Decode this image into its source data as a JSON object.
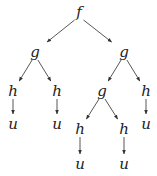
{
  "diagram": {
    "type": "tree",
    "nodes": [
      {
        "id": "n0",
        "label": "f",
        "x": 79,
        "y": 13
      },
      {
        "id": "n1",
        "label": "g",
        "x": 35,
        "y": 53
      },
      {
        "id": "n2",
        "label": "g",
        "x": 124,
        "y": 53
      },
      {
        "id": "n3",
        "label": "h",
        "x": 13,
        "y": 92
      },
      {
        "id": "n4",
        "label": "h",
        "x": 57,
        "y": 92
      },
      {
        "id": "n5",
        "label": "g",
        "x": 102,
        "y": 92
      },
      {
        "id": "n6",
        "label": "h",
        "x": 146,
        "y": 92
      },
      {
        "id": "n7",
        "label": "u",
        "x": 13,
        "y": 125
      },
      {
        "id": "n8",
        "label": "u",
        "x": 57,
        "y": 125
      },
      {
        "id": "n9",
        "label": "h",
        "x": 80,
        "y": 130
      },
      {
        "id": "n10",
        "label": "h",
        "x": 124,
        "y": 130
      },
      {
        "id": "n11",
        "label": "u",
        "x": 146,
        "y": 125
      },
      {
        "id": "n12",
        "label": "u",
        "x": 80,
        "y": 165
      },
      {
        "id": "n13",
        "label": "u",
        "x": 124,
        "y": 165
      }
    ],
    "edges": [
      [
        "n0",
        "n1"
      ],
      [
        "n0",
        "n2"
      ],
      [
        "n1",
        "n3"
      ],
      [
        "n1",
        "n4"
      ],
      [
        "n2",
        "n5"
      ],
      [
        "n2",
        "n6"
      ],
      [
        "n3",
        "n7"
      ],
      [
        "n4",
        "n8"
      ],
      [
        "n5",
        "n9"
      ],
      [
        "n5",
        "n10"
      ],
      [
        "n6",
        "n11"
      ],
      [
        "n9",
        "n12"
      ],
      [
        "n10",
        "n13"
      ]
    ]
  }
}
